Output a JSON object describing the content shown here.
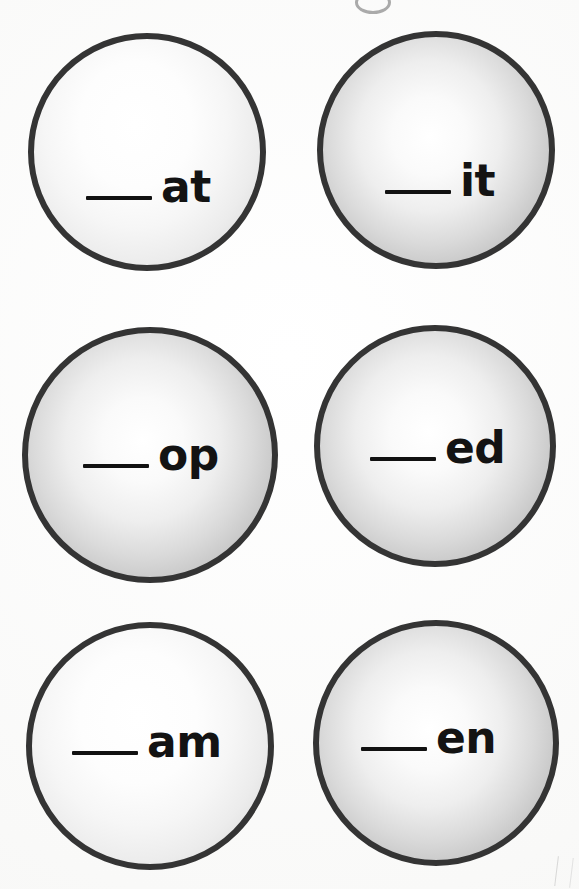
{
  "worksheet": {
    "title": "Word Family Circles",
    "background_color": "#ffffff",
    "ring_color": "#343434",
    "text_color": "#131313",
    "blank_label": "blank-line",
    "columns": 2,
    "rows": 3,
    "bubble_count": 6
  },
  "artifacts": {
    "top_partial_circle": "partial-gray-circle-outline",
    "bottom_right_mark": "faint-page-edge-mark"
  },
  "bubbles": [
    {
      "id": "bubble-at",
      "ending": "at",
      "shade": "soft",
      "left": 28,
      "top": 33,
      "size": 238,
      "prompt_left": 52,
      "prompt_top": 126,
      "row": 1,
      "column": 1
    },
    {
      "id": "bubble-it",
      "ending": "it",
      "shade": "strong",
      "left": 317,
      "top": 31,
      "size": 238,
      "prompt_left": 62,
      "prompt_top": 122,
      "row": 1,
      "column": 2
    },
    {
      "id": "bubble-op",
      "ending": "op",
      "shade": "strong",
      "left": 22,
      "top": 327,
      "size": 256,
      "prompt_left": 55,
      "prompt_top": 100,
      "row": 2,
      "column": 1
    },
    {
      "id": "bubble-ed",
      "ending": "ed",
      "shade": "strong",
      "left": 314,
      "top": 325,
      "size": 242,
      "prompt_left": 50,
      "prompt_top": 95,
      "row": 2,
      "column": 2
    },
    {
      "id": "bubble-am",
      "ending": "am",
      "shade": "soft",
      "left": 26,
      "top": 622,
      "size": 248,
      "prompt_left": 40,
      "prompt_top": 92,
      "row": 3,
      "column": 1
    },
    {
      "id": "bubble-en",
      "ending": "en",
      "shade": "strong",
      "left": 313,
      "top": 620,
      "size": 246,
      "prompt_left": 42,
      "prompt_top": 90,
      "row": 3,
      "column": 2
    }
  ]
}
